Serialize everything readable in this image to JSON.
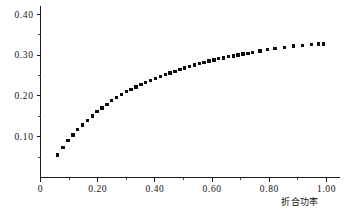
{
  "chart_data": {
    "type": "scatter",
    "title": "",
    "xlabel": "折合功率",
    "ylabel": "性能系数",
    "xlim": [
      0.0,
      1.04
    ],
    "ylim": [
      0.0,
      0.42
    ],
    "grid": false,
    "legend": null,
    "x_ticks_major": [
      "0",
      "0.20",
      "0.40",
      "0.60",
      "0.80",
      "1.00"
    ],
    "x_tick_values": [
      0.0,
      0.2,
      0.4,
      0.6,
      0.8,
      1.0
    ],
    "x_ticks_minor": [
      0.1,
      0.3,
      0.5,
      0.7,
      0.9
    ],
    "y_ticks_major": [
      "0.10",
      "0.20",
      "0.30",
      "0.40"
    ],
    "y_tick_values": [
      0.1,
      0.2,
      0.3,
      0.4
    ],
    "y_ticks_minor": [
      0.05,
      0.15,
      0.25,
      0.35
    ],
    "marker": "filled-square",
    "marker_color": "#0d0d0d",
    "x": [
      0.06,
      0.078,
      0.096,
      0.113,
      0.13,
      0.147,
      0.164,
      0.181,
      0.198,
      0.215,
      0.232,
      0.249,
      0.266,
      0.283,
      0.3,
      0.317,
      0.334,
      0.351,
      0.368,
      0.385,
      0.402,
      0.419,
      0.436,
      0.453,
      0.47,
      0.487,
      0.504,
      0.521,
      0.538,
      0.555,
      0.572,
      0.589,
      0.606,
      0.623,
      0.64,
      0.657,
      0.674,
      0.691,
      0.708,
      0.725,
      0.742,
      0.768,
      0.794,
      0.82,
      0.852,
      0.884,
      0.916,
      0.948,
      0.972,
      0.99
    ],
    "y": [
      0.055,
      0.073,
      0.09,
      0.104,
      0.117,
      0.129,
      0.14,
      0.151,
      0.161,
      0.17,
      0.179,
      0.188,
      0.196,
      0.203,
      0.21,
      0.216,
      0.222,
      0.228,
      0.233,
      0.238,
      0.243,
      0.248,
      0.252,
      0.256,
      0.26,
      0.265,
      0.268,
      0.272,
      0.276,
      0.279,
      0.282,
      0.285,
      0.288,
      0.291,
      0.293,
      0.296,
      0.298,
      0.3,
      0.302,
      0.304,
      0.306,
      0.31,
      0.313,
      0.316,
      0.319,
      0.322,
      0.324,
      0.326,
      0.327,
      0.327
    ]
  },
  "figure": {
    "axis_color": "#1a1a1a",
    "background": "#ffffff",
    "ylabel_chars": [
      "性",
      "能",
      "系",
      "数"
    ]
  }
}
